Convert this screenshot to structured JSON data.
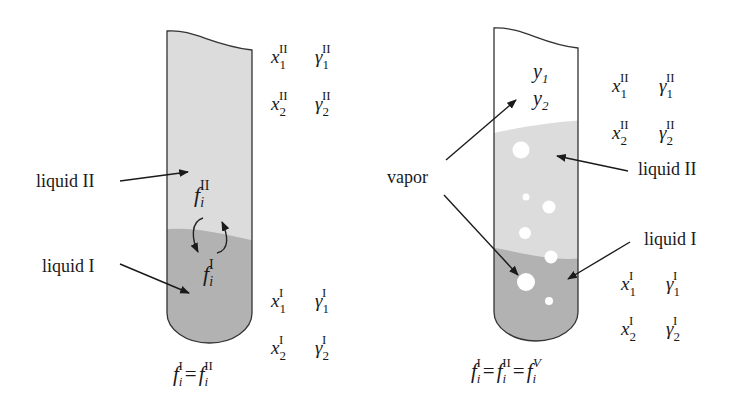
{
  "left_panel": {
    "labels": {
      "liquid_II": "liquid II",
      "liquid_I": "liquid I"
    },
    "tube_symbols": {
      "f_II": "f",
      "f_II_sub": "i",
      "f_II_sup": "II",
      "f_I": "f",
      "f_I_sub": "i",
      "f_I_sup": "I"
    },
    "phase_II_vars": [
      {
        "x": "x",
        "x_sub": "1",
        "x_sup": "II",
        "g": "γ",
        "g_sub": "1",
        "g_sup": "II"
      },
      {
        "x": "x",
        "x_sub": "2",
        "x_sup": "II",
        "g": "γ",
        "g_sub": "2",
        "g_sup": "II"
      }
    ],
    "phase_I_vars": [
      {
        "x": "x",
        "x_sub": "1",
        "x_sup": "I",
        "g": "γ",
        "g_sub": "1",
        "g_sup": "I"
      },
      {
        "x": "x",
        "x_sub": "2",
        "x_sup": "I",
        "g": "γ",
        "g_sub": "2",
        "g_sup": "I"
      }
    ],
    "equation": {
      "f1": "f",
      "s1": "i",
      "p1": "I",
      "eq": "=",
      "f2": "f",
      "s2": "i",
      "p2": "II"
    }
  },
  "right_panel": {
    "labels": {
      "vapor": "vapor",
      "liquid_II": "liquid II",
      "liquid_I": "liquid I"
    },
    "vapor_vars": [
      {
        "y": "y",
        "sub": "1"
      },
      {
        "y": "y",
        "sub": "2"
      }
    ],
    "phase_II_vars": [
      {
        "x": "x",
        "x_sub": "1",
        "x_sup": "II",
        "g": "γ",
        "g_sub": "1",
        "g_sup": "II"
      },
      {
        "x": "x",
        "x_sub": "2",
        "x_sup": "II",
        "g": "γ",
        "g_sub": "2",
        "g_sup": "II"
      }
    ],
    "phase_I_vars": [
      {
        "x": "x",
        "x_sub": "1",
        "x_sup": "I",
        "g": "γ",
        "g_sub": "1",
        "g_sup": "I"
      },
      {
        "x": "x",
        "x_sub": "2",
        "x_sup": "I",
        "g": "γ",
        "g_sub": "2",
        "g_sup": "I"
      }
    ],
    "equation": {
      "f1": "f",
      "s1": "i",
      "p1": "I",
      "eq1": "=",
      "f2": "f",
      "s2": "i",
      "p2": "II",
      "eq2": "=",
      "f3": "f",
      "s3": "i",
      "p3": "V"
    }
  },
  "colors": {
    "liquid_II": "#dcdcdc",
    "liquid_I": "#b2b2b2",
    "outline": "#333333",
    "bubble": "#ffffff"
  }
}
